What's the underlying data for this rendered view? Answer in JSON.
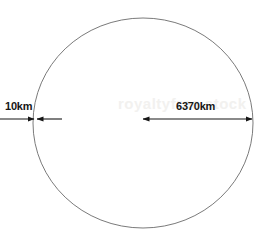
{
  "figure": {
    "name": "earth-atmosphere-scale-diagram",
    "background_color": "#ffffff",
    "stroke_color": "#6b6b6b",
    "annotation_color": "#161616"
  },
  "circle": {
    "name": "earth-circle",
    "cx": 143,
    "cy": 123,
    "rx": 110,
    "ry": 105,
    "stroke_color": "#6b6b6b",
    "stroke_width": 0.9,
    "fill": "none"
  },
  "annotations": [
    {
      "id": "atmosphere",
      "label": "10km",
      "arrow_style": "inward-double-arrow",
      "line_y": 119,
      "line_x_start": 0,
      "line_x_end": 62,
      "meet_x": 34,
      "label_x": 5,
      "label_y": 101
    },
    {
      "id": "radius",
      "label": "6370km",
      "arrow_style": "double-headed-arrow",
      "line_y": 119,
      "line_x_start": 143,
      "line_x_end": 252,
      "label_x": 176,
      "label_y": 101
    }
  ],
  "watermark": {
    "text": "royaltyfree stock",
    "color": "#f2f1ef"
  }
}
